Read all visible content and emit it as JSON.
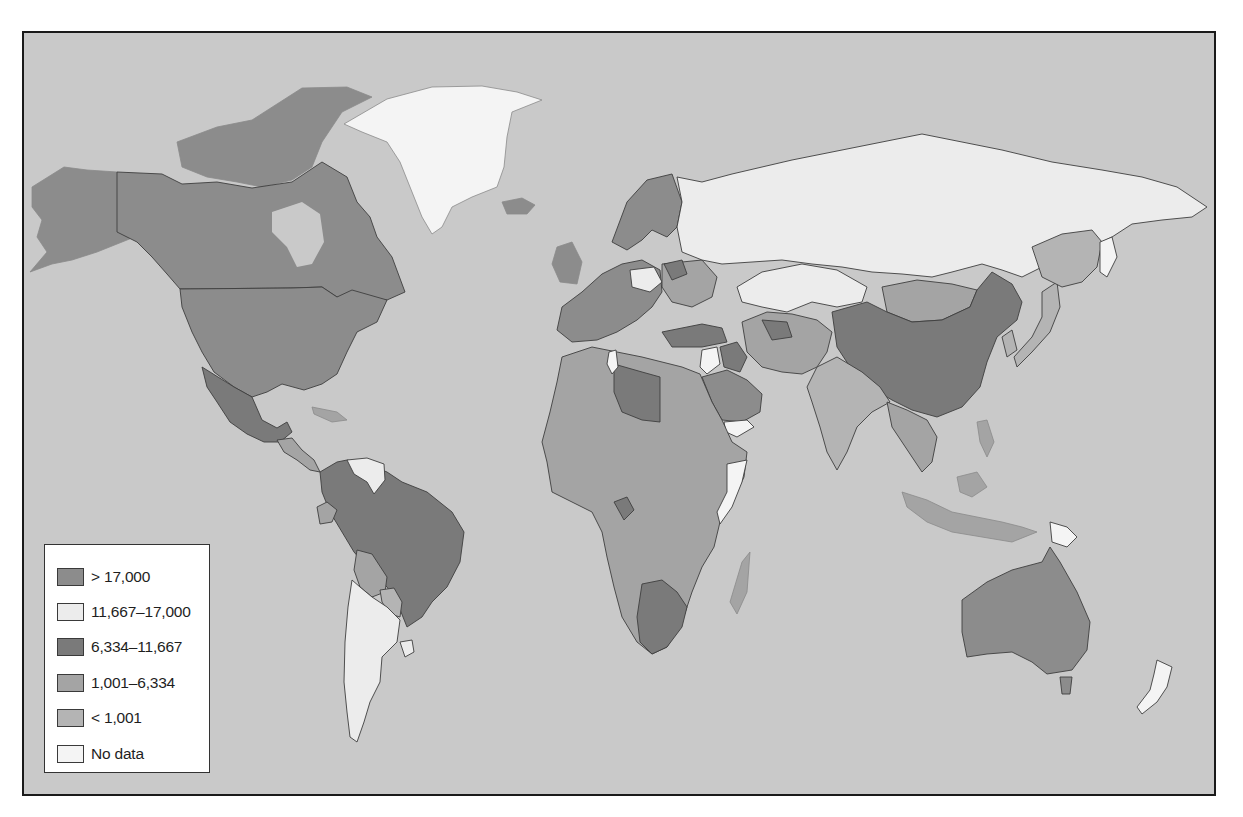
{
  "map": {
    "type": "choropleth-world-map",
    "background_color": "#c9c9c9",
    "frame_color": "#1a1a1a"
  },
  "legend": {
    "items": [
      {
        "label": "> 17,000",
        "color": "#8c8c8c",
        "category": "gt_17000"
      },
      {
        "label": "11,667–17,000",
        "color": "#ececec",
        "category": "11667_17000"
      },
      {
        "label": "6,334–11,667",
        "color": "#7a7a7a",
        "category": "6334_11667"
      },
      {
        "label": "1,001–6,334",
        "color": "#a4a4a4",
        "category": "1001_6334"
      },
      {
        "label": "< 1,001",
        "color": "#b4b4b4",
        "category": "lt_1001"
      },
      {
        "label": "No data",
        "color": "#f4f4f4",
        "category": "no_data"
      }
    ]
  },
  "regions": {
    "gt_17000": [
      "Canada",
      "United States",
      "Alaska",
      "Australia",
      "Norway",
      "Sweden",
      "Finland",
      "United Kingdom",
      "Iceland",
      "France",
      "Germany",
      "Spain",
      "Italy",
      "Saudi Arabia"
    ],
    "11667_17000": [
      "Russia",
      "Kazakhstan",
      "Argentina",
      "Chile",
      "Venezuela",
      "Poland",
      "New Zealand",
      "Uruguay"
    ],
    "6334_11667": [
      "Mexico",
      "Brazil",
      "Colombia",
      "Peru",
      "China",
      "Libya",
      "Turkey",
      "Iraq",
      "South Africa",
      "Belarus",
      "Turkmenistan",
      "Gabon",
      "Malaysia"
    ],
    "1001_6334": [
      "Bolivia",
      "Paraguay",
      "Ecuador",
      "Iran",
      "Algeria",
      "Egypt",
      "Mongolia",
      "Ukraine",
      "Thailand",
      "Indonesia"
    ],
    "lt_1001": [
      "India",
      "Afghanistan",
      "Pakistan",
      "Sudan",
      "Ethiopia",
      "Nigeria",
      "Mali",
      "Chad",
      "Niger",
      "DR Congo",
      "Angola",
      "Tanzania",
      "Mozambique",
      "Madagascar",
      "Japan",
      "Myanmar"
    ],
    "no_data": [
      "Greenland",
      "Somalia",
      "Yemen",
      "Syria",
      "Tunisia",
      "Papua New Guinea",
      "Suriname",
      "Sakhalin"
    ]
  }
}
